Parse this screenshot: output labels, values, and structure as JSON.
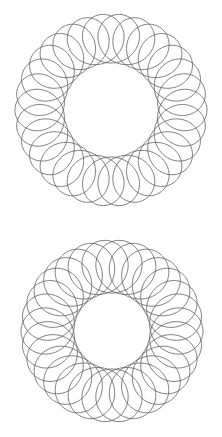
{
  "image": {
    "description": "Two hand-drawn spirograph (hypotrochoid) patterns stacked vertically on white paper",
    "background": "#ffffff",
    "stroke_color": "#555555",
    "figures": [
      {
        "name": "top-spirograph",
        "cx": 111,
        "cy": 110,
        "outer_r": 96,
        "inner_r": 47,
        "loops": 30
      },
      {
        "name": "bottom-spirograph",
        "cx": 112,
        "cy": 331,
        "outer_r": 91,
        "inner_r": 38,
        "loops": 30
      }
    ]
  }
}
